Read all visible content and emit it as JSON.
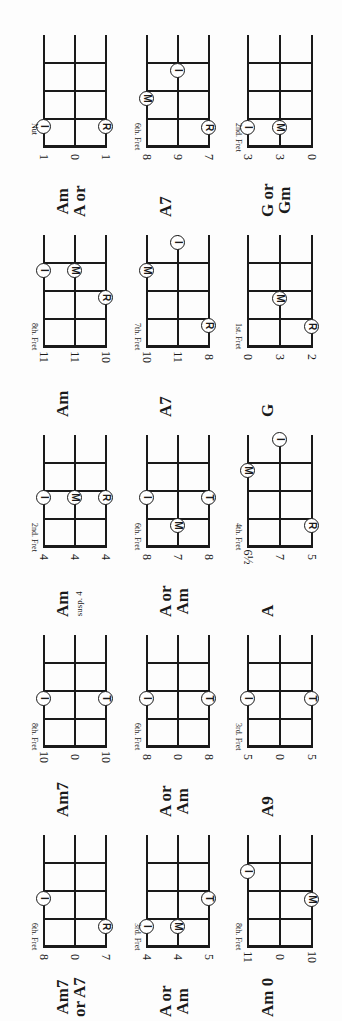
{
  "chart_data": {
    "type": "chord-diagrams",
    "orientation": "page rotated 90deg counter-clockwise",
    "finger_legend": {
      "I": "index",
      "M": "middle",
      "R": "ring",
      "T": "third/little"
    },
    "diagrams": [
      {
        "id": "r1c1",
        "chord": "Am",
        "chord_line2": "A or",
        "fret_label": "Nut",
        "strings": [
          "1",
          "0",
          "1"
        ],
        "dots": [
          {
            "finger": "I",
            "string": 0,
            "y": 91
          },
          {
            "finger": "R",
            "string": 2,
            "y": 91
          }
        ]
      },
      {
        "id": "r1c2",
        "chord": "A7",
        "chord_line2": "",
        "fret_label": "6th. Fret",
        "strings": [
          "8",
          "9",
          "7"
        ],
        "dots": [
          {
            "finger": "M",
            "string": 0,
            "y": 63
          },
          {
            "finger": "I",
            "string": 1,
            "y": 35
          },
          {
            "finger": "R",
            "string": 2,
            "y": 92
          }
        ]
      },
      {
        "id": "r1c3",
        "chord": "G or",
        "chord_line2": "Gm",
        "fret_label": "2nd. Fret",
        "strings": [
          "3",
          "3",
          "0"
        ],
        "dots": [
          {
            "finger": "I",
            "string": 0,
            "y": 92
          },
          {
            "finger": "M",
            "string": 1,
            "y": 92
          }
        ]
      },
      {
        "id": "r2c1",
        "chord": "Am",
        "chord_line2": "",
        "fret_label": "8th. Fret",
        "strings": [
          "11",
          "11",
          "10"
        ],
        "dots": [
          {
            "finger": "I",
            "string": 0,
            "y": 35
          },
          {
            "finger": "M",
            "string": 1,
            "y": 35
          },
          {
            "finger": "R",
            "string": 2,
            "y": 62
          }
        ]
      },
      {
        "id": "r2c2",
        "chord": "A7",
        "chord_line2": "",
        "fret_label": "7th. Fret",
        "strings": [
          "10",
          "11",
          "8"
        ],
        "dots": [
          {
            "finger": "M",
            "string": 0,
            "y": 35
          },
          {
            "finger": "I",
            "string": 1,
            "y": 7
          },
          {
            "finger": "R",
            "string": 2,
            "y": 90
          }
        ]
      },
      {
        "id": "r2c3",
        "chord": "G",
        "chord_line2": "",
        "fret_label": "1st. Fret",
        "strings": [
          "0",
          "3",
          "2"
        ],
        "dots": [
          {
            "finger": "M",
            "string": 1,
            "y": 63
          },
          {
            "finger": "R",
            "string": 2,
            "y": 91
          }
        ]
      },
      {
        "id": "r3c1",
        "chord": "Am",
        "chord_line2": "susp. 4",
        "fret_label": "2nd. Fret",
        "strings": [
          "4",
          "4",
          "4"
        ],
        "dots": [
          {
            "finger": "I",
            "string": 0,
            "y": 62
          },
          {
            "finger": "M",
            "string": 1,
            "y": 62
          },
          {
            "finger": "R",
            "string": 2,
            "y": 62
          }
        ]
      },
      {
        "id": "r3c2",
        "chord": "A or",
        "chord_line2": "Am",
        "fret_label": "6th. Fret",
        "strings": [
          "8",
          "7",
          "8"
        ],
        "dots": [
          {
            "finger": "I",
            "string": 0,
            "y": 62
          },
          {
            "finger": "M",
            "string": 1,
            "y": 90
          },
          {
            "finger": "T",
            "string": 2,
            "y": 62
          }
        ]
      },
      {
        "id": "r3c3",
        "chord": "A",
        "chord_line2": "",
        "fret_label": "4th. Fret",
        "strings": [
          "6½",
          "7",
          "5"
        ],
        "dots": [
          {
            "finger": "M",
            "string": 0,
            "y": 35
          },
          {
            "finger": "I",
            "string": 1,
            "y": 4
          },
          {
            "finger": "R",
            "string": 2,
            "y": 90
          }
        ]
      },
      {
        "id": "r4c1",
        "chord": "Am7",
        "chord_line2": "",
        "fret_label": "8th. Fret",
        "strings": [
          "10",
          "0",
          "10"
        ],
        "dots": [
          {
            "finger": "I",
            "string": 0,
            "y": 63
          },
          {
            "finger": "T",
            "string": 2,
            "y": 63
          }
        ]
      },
      {
        "id": "r4c2",
        "chord": "A or",
        "chord_line2": "Am",
        "fret_label": "6th. Fret",
        "strings": [
          "8",
          "0",
          "8"
        ],
        "dots": [
          {
            "finger": "I",
            "string": 0,
            "y": 63
          },
          {
            "finger": "T",
            "string": 2,
            "y": 63
          }
        ]
      },
      {
        "id": "r4c3",
        "chord": "A9",
        "chord_line2": "",
        "fret_label": "3rd. Fret",
        "strings": [
          "5",
          "0",
          "5"
        ],
        "dots": [
          {
            "finger": "I",
            "string": 0,
            "y": 63
          },
          {
            "finger": "T",
            "string": 2,
            "y": 63
          }
        ]
      },
      {
        "id": "r5c1",
        "chord": "Am7",
        "chord_line2": "or A7",
        "fret_label": "6th. Fret",
        "strings": [
          "8",
          "0",
          "7"
        ],
        "dots": [
          {
            "finger": "I",
            "string": 0,
            "y": 63
          },
          {
            "finger": "R",
            "string": 2,
            "y": 91
          }
        ]
      },
      {
        "id": "r5c2",
        "chord": "A or",
        "chord_line2": "Am",
        "fret_label": "3rd. Fret",
        "strings": [
          "4",
          "4",
          "5"
        ],
        "dots": [
          {
            "finger": "I",
            "string": 0,
            "y": 91
          },
          {
            "finger": "M",
            "string": 1,
            "y": 91
          },
          {
            "finger": "T",
            "string": 2,
            "y": 63
          }
        ]
      },
      {
        "id": "r5c3",
        "chord": "Am 0",
        "chord_line2": "",
        "fret_label": "8th. Fret",
        "strings": [
          "11",
          "0",
          "10"
        ],
        "dots": [
          {
            "finger": "I",
            "string": 0,
            "y": 36
          },
          {
            "finger": "M",
            "string": 2,
            "y": 64
          }
        ]
      }
    ]
  }
}
